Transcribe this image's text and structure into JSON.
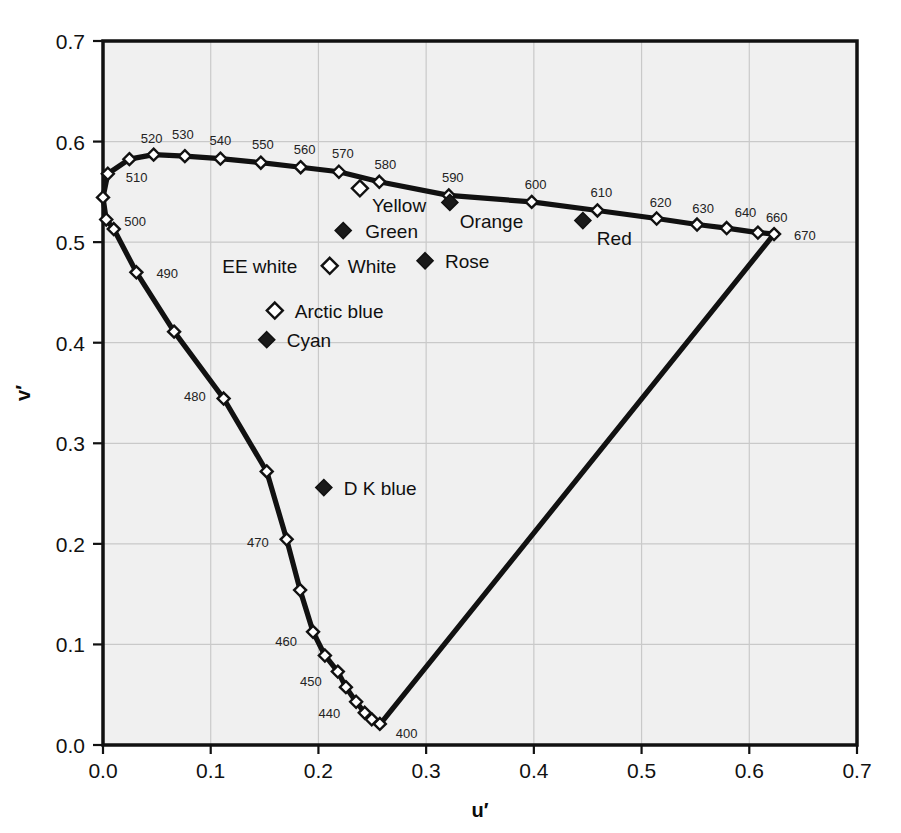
{
  "chart_data": {
    "type": "line",
    "title": "",
    "xlabel": "u′",
    "ylabel": "v′",
    "xlim": [
      0.0,
      0.7
    ],
    "ylim": [
      0.0,
      0.7
    ],
    "grid": true,
    "legend": "none",
    "xticks": [
      "0.0",
      "0.1",
      "0.2",
      "0.3",
      "0.4",
      "0.5",
      "0.6",
      "0.7"
    ],
    "yticks": [
      "0.0",
      "0.1",
      "0.2",
      "0.3",
      "0.4",
      "0.5",
      "0.6",
      "0.7"
    ],
    "xtick_values": [
      0.0,
      0.1,
      0.2,
      0.3,
      0.4,
      0.5,
      0.6,
      0.7
    ],
    "ytick_values": [
      0.0,
      0.1,
      0.2,
      0.3,
      0.4,
      0.5,
      0.6,
      0.7
    ],
    "series": [
      {
        "name": "spectral locus",
        "marker": "open-diamond",
        "points": [
          {
            "label": "",
            "u": 0.256,
            "v": 0.019
          },
          {
            "label": "400",
            "u": 0.257,
            "v": 0.021
          },
          {
            "label": "",
            "u": 0.2495,
            "v": 0.0255
          },
          {
            "label": "",
            "u": 0.243,
            "v": 0.032
          },
          {
            "label": "440",
            "u": 0.235,
            "v": 0.043
          },
          {
            "label": "",
            "u": 0.2255,
            "v": 0.0575
          },
          {
            "label": "450",
            "u": 0.218,
            "v": 0.073
          },
          {
            "label": "",
            "u": 0.206,
            "v": 0.089
          },
          {
            "label": "460",
            "u": 0.195,
            "v": 0.1125
          },
          {
            "label": "",
            "u": 0.183,
            "v": 0.154
          },
          {
            "label": "470",
            "u": 0.1705,
            "v": 0.2045
          },
          {
            "label": "",
            "u": 0.152,
            "v": 0.272
          },
          {
            "label": "480",
            "u": 0.112,
            "v": 0.3445
          },
          {
            "label": "",
            "u": 0.066,
            "v": 0.411
          },
          {
            "label": "490",
            "u": 0.031,
            "v": 0.47
          },
          {
            "label": "",
            "u": 0.01,
            "v": 0.513
          },
          {
            "label": "500",
            "u": 0.003,
            "v": 0.5225
          },
          {
            "label": "",
            "u": 0.0,
            "v": 0.5445
          },
          {
            "label": "510",
            "u": 0.0045,
            "v": 0.568
          },
          {
            "label": "",
            "u": 0.0245,
            "v": 0.5825
          },
          {
            "label": "520",
            "u": 0.047,
            "v": 0.587
          },
          {
            "label": "530",
            "u": 0.076,
            "v": 0.5855
          },
          {
            "label": "540",
            "u": 0.109,
            "v": 0.583
          },
          {
            "label": "550",
            "u": 0.1465,
            "v": 0.579
          },
          {
            "label": "560",
            "u": 0.1835,
            "v": 0.5745
          },
          {
            "label": "570",
            "u": 0.219,
            "v": 0.57
          },
          {
            "label": "580",
            "u": 0.2565,
            "v": 0.56
          },
          {
            "label": "590",
            "u": 0.321,
            "v": 0.5465
          },
          {
            "label": "600",
            "u": 0.398,
            "v": 0.54
          },
          {
            "label": "610",
            "u": 0.459,
            "v": 0.5315
          },
          {
            "label": "620",
            "u": 0.514,
            "v": 0.5235
          },
          {
            "label": "630",
            "u": 0.5515,
            "v": 0.5175
          },
          {
            "label": "640",
            "u": 0.579,
            "v": 0.514
          },
          {
            "label": "660",
            "u": 0.608,
            "v": 0.5095
          },
          {
            "label": "670",
            "u": 0.623,
            "v": 0.508
          }
        ]
      }
    ],
    "purple_line": {
      "from": {
        "u": 0.623,
        "v": 0.508
      },
      "to": {
        "u": 0.256,
        "v": 0.019
      }
    },
    "color_points": [
      {
        "name": "Green",
        "label": "Green",
        "u": 0.223,
        "v": 0.5115,
        "marker": "filled-diamond",
        "label_side": "right"
      },
      {
        "name": "Yellow",
        "label": "Yellow",
        "u": 0.2385,
        "v": 0.5535,
        "marker": "open-diamond",
        "label_side": "right-below"
      },
      {
        "name": "Orange",
        "label": "Orange",
        "u": 0.322,
        "v": 0.5395,
        "marker": "filled-diamond",
        "label_side": "right-below"
      },
      {
        "name": "Red",
        "label": "Red",
        "u": 0.4455,
        "v": 0.5215,
        "marker": "filled-diamond",
        "label_side": "right-below"
      },
      {
        "name": "White",
        "label": "White",
        "u": 0.2105,
        "v": 0.4765,
        "marker": "open-diamond",
        "label_side": "right"
      },
      {
        "name": "Rose",
        "label": "Rose",
        "u": 0.299,
        "v": 0.4815,
        "marker": "filled-diamond",
        "label_side": "right"
      },
      {
        "name": "Arctic blue",
        "label": "Arctic blue",
        "u": 0.1595,
        "v": 0.432,
        "marker": "open-diamond",
        "label_side": "right"
      },
      {
        "name": "Cyan",
        "label": "Cyan",
        "u": 0.152,
        "v": 0.403,
        "marker": "filled-diamond",
        "label_side": "right"
      },
      {
        "name": "D K blue",
        "label": "D K blue",
        "u": 0.205,
        "v": 0.256,
        "marker": "filled-diamond",
        "label_side": "right"
      }
    ],
    "annotations": [
      {
        "text": "EE white",
        "u": 0.1455,
        "v": 0.469,
        "anchor": "middle"
      }
    ]
  },
  "colors": {
    "plot_background": "#f0f0f0",
    "page_background": "#ffffff",
    "axis": "#111111",
    "grid": "#c9c9c9",
    "curve": "#111111",
    "marker_fill_open": "#ffffff",
    "marker_fill_solid": "#1a1a1a",
    "text": "#111111"
  }
}
